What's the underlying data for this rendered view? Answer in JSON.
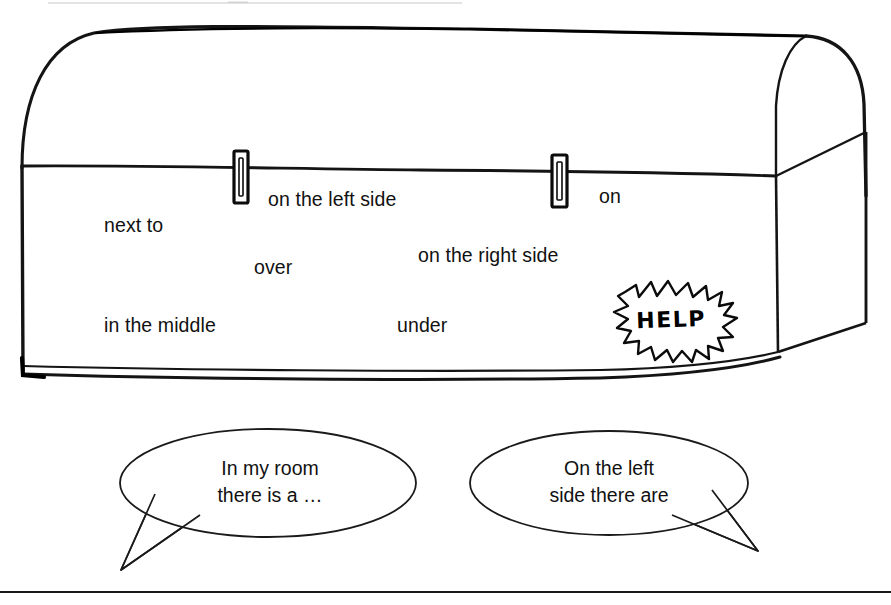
{
  "page": {
    "background_color": "#ffffff",
    "ink_color": "#000000",
    "width": 891,
    "height": 605
  },
  "illustration": {
    "name": "treasure-chest",
    "description": "hand-drawn treasure chest with domed lid, two clasps and a base rim",
    "clasps": 2
  },
  "prepositions": [
    {
      "id": "next-to",
      "label": "next to"
    },
    {
      "id": "on-the-left-side",
      "label": "on the left side"
    },
    {
      "id": "on",
      "label": "on"
    },
    {
      "id": "on-the-right-side",
      "label": "on the right side"
    },
    {
      "id": "over",
      "label": "over"
    },
    {
      "id": "in-the-middle",
      "label": "in the middle"
    },
    {
      "id": "under",
      "label": "under"
    }
  ],
  "help_badge": {
    "label": "HELP",
    "shape": "starburst"
  },
  "speech_bubbles": [
    {
      "id": "bubble-left",
      "line1": "In my room",
      "line2": "there is a …",
      "tail_direction": "down-left"
    },
    {
      "id": "bubble-right",
      "line1": "On the left",
      "line2": "side there are",
      "tail_direction": "down-right"
    }
  ],
  "rules": {
    "top_rule": "partial hairline at top edge",
    "bottom_rule": "full-width horizontal rule"
  }
}
